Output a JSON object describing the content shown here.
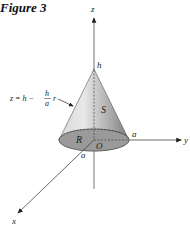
{
  "figure": {
    "title": "Figure 3",
    "labels": {
      "z_axis": "z",
      "y_axis": "y",
      "x_axis": "x",
      "apex": "h",
      "surface": "S",
      "region": "R",
      "origin": "O",
      "radius_y": "a",
      "radius_x": "a",
      "equation_lhs": "z = h −",
      "equation_num": "h",
      "equation_den": "a",
      "equation_var": "r"
    },
    "colors": {
      "cone_light": "#e0e0e0",
      "cone_dark": "#8c8c8c",
      "base_fill": "#9a9a9a",
      "axis": "#333333"
    }
  }
}
